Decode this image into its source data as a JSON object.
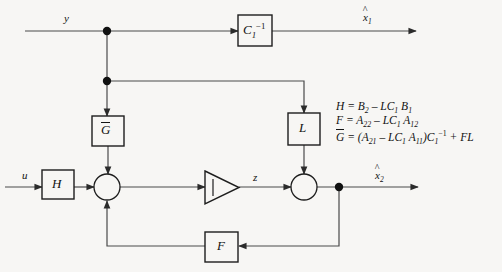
{
  "diagram": {
    "background_color": "#f7f6f4",
    "line_color": "#3a3a3a",
    "blocks": [
      {
        "id": "c1inv",
        "label": "C",
        "sub": "1",
        "sup": "-1",
        "x": 238,
        "y": 15,
        "w": 34,
        "h": 31
      },
      {
        "id": "gbar",
        "label": "G",
        "overline": true,
        "x": 92,
        "y": 116,
        "w": 32,
        "h": 30
      },
      {
        "id": "l",
        "label": "L",
        "x": 288,
        "y": 113,
        "w": 32,
        "h": 32
      },
      {
        "id": "h",
        "label": "H",
        "x": 42,
        "y": 170,
        "w": 32,
        "h": 29
      },
      {
        "id": "f",
        "label": "F",
        "x": 205,
        "y": 232,
        "w": 33,
        "h": 30
      }
    ],
    "summers": [
      {
        "id": "sum1",
        "cx": 107,
        "cy": 187,
        "r": 13
      },
      {
        "id": "sum2",
        "cx": 304,
        "cy": 187,
        "r": 13
      }
    ],
    "integrator": {
      "id": "integrator",
      "symbol": "integral",
      "x": 205,
      "y": 171,
      "w": 34,
      "h": 33
    },
    "junction_dots": [
      {
        "id": "dot-y-top",
        "cx": 107,
        "cy": 31
      },
      {
        "id": "dot-y-branch",
        "cx": 107,
        "cy": 81
      },
      {
        "id": "dot-x2-branch",
        "cx": 339,
        "cy": 187
      }
    ],
    "signals": [
      {
        "id": "input-y",
        "label": "y",
        "x": 64,
        "y": 13
      },
      {
        "id": "output-x1",
        "label": "x",
        "hat": true,
        "sub": "1",
        "x": 363,
        "y": 12
      },
      {
        "id": "input-u",
        "label": "u",
        "x": 22,
        "y": 170
      },
      {
        "id": "signal-z",
        "label": "z",
        "x": 253,
        "y": 172
      },
      {
        "id": "output-x2",
        "label": "x",
        "hat": true,
        "sub": "2",
        "x": 375,
        "y": 170
      }
    ],
    "equations": [
      {
        "id": "eq-H",
        "lhs": "H",
        "html": "H = B<sub>2</sub> &ndash; LC<sub>1</sub> B<sub>1</sub>",
        "plain": "H = B2 - LC1 B1"
      },
      {
        "id": "eq-F",
        "lhs": "F",
        "html": "F = A<sub>22</sub> &ndash; LC<sub>1</sub> A<sub>12</sub>",
        "plain": "F = A22 - LC1 A12"
      },
      {
        "id": "eq-Gbar",
        "lhs": "Gbar",
        "html": "<span class=\"ovl\">G</span> = (A<sub>21</sub> &ndash; LC<sub>1</sub> A<sub>11</sub>)C<sub>1</sub><sup>&minus;1</sup> + FL",
        "plain": "Gbar = (A21 - LC1 A11)C1^-1 + FL"
      }
    ]
  }
}
